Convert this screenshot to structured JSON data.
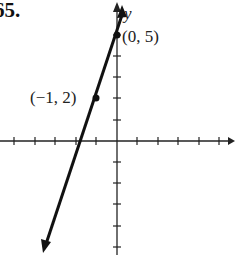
{
  "problem_number": "65.",
  "axes": {
    "y_label": "y",
    "x_label": "x"
  },
  "points": [
    {
      "label": "(0, 5)",
      "x": 0,
      "y": 5
    },
    {
      "label": "(−1, 2)",
      "x": -1,
      "y": 2
    }
  ],
  "line": {
    "equation_implied": "y = 3x + 5",
    "slope": 3,
    "intercept": 5
  },
  "grid": {
    "x_ticks": [
      -5,
      -4,
      -3,
      -2,
      -1,
      1,
      2,
      3,
      4,
      5
    ],
    "y_ticks": [
      -5,
      -4,
      -3,
      -2,
      -1,
      1,
      2,
      3,
      4,
      5
    ]
  }
}
